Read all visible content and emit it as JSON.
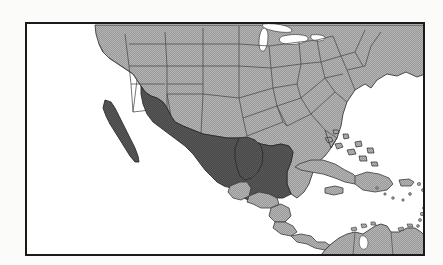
{
  "figure": {
    "type": "reference-map",
    "title": "Map of North America, Central America and the Caribbean with Mexico highlighted",
    "caption": "",
    "frame": {
      "x": 25,
      "y": 22,
      "width": 400,
      "height": 234,
      "border_color": "#1a1a1a",
      "border_width_px": 2,
      "background_color": "#ffffff"
    },
    "page_background_color": "#fbfbfa"
  },
  "legend": {
    "highlight_label": "Mexico",
    "highlight_color": "#555555",
    "context_label": "Surrounding countries and United States states",
    "context_color": "#aaaaaa",
    "water_label": "Ocean, gulf and lakes",
    "water_color": "#ffffff",
    "outline_color": "#3a3a3a"
  },
  "regions": {
    "highlighted": [
      {
        "name": "Mexico",
        "shade": "dark"
      }
    ],
    "shaded": [
      {
        "name": "United States",
        "shade": "light"
      },
      {
        "name": "Canada",
        "shade": "light"
      },
      {
        "name": "Guatemala",
        "shade": "light"
      },
      {
        "name": "Belize",
        "shade": "light"
      },
      {
        "name": "Honduras",
        "shade": "light"
      },
      {
        "name": "El Salvador",
        "shade": "light"
      },
      {
        "name": "Nicaragua",
        "shade": "light"
      },
      {
        "name": "Costa Rica",
        "shade": "light"
      },
      {
        "name": "Panama",
        "shade": "light"
      },
      {
        "name": "Cuba",
        "shade": "light"
      },
      {
        "name": "The Bahamas",
        "shade": "light"
      },
      {
        "name": "Jamaica",
        "shade": "light"
      },
      {
        "name": "Haiti",
        "shade": "light"
      },
      {
        "name": "Dominican Republic",
        "shade": "light"
      },
      {
        "name": "Puerto Rico",
        "shade": "light"
      },
      {
        "name": "Lesser Antilles",
        "shade": "light"
      },
      {
        "name": "Colombia",
        "shade": "light"
      },
      {
        "name": "Venezuela",
        "shade": "light"
      }
    ],
    "water_bodies": [
      {
        "name": "Pacific Ocean"
      },
      {
        "name": "Gulf of Mexico"
      },
      {
        "name": "Caribbean Sea"
      },
      {
        "name": "Atlantic Ocean"
      },
      {
        "name": "Great Lakes"
      }
    ]
  },
  "labels": []
}
